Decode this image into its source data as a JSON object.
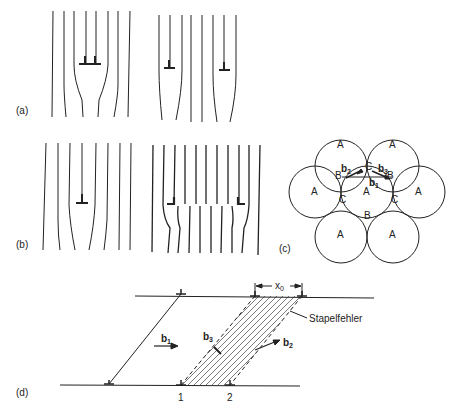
{
  "panels": {
    "a": {
      "label": "(a)"
    },
    "b": {
      "label": "(b)"
    },
    "c": {
      "label": "(c)",
      "atoms": [
        "A",
        "A",
        "A",
        "A",
        "A",
        "A",
        "A"
      ],
      "sites": {
        "B": "B",
        "C": "C"
      },
      "vectors": {
        "b1": "b",
        "b1_sub": "1",
        "b2": "b",
        "b2_sub": "2",
        "b3": "b",
        "b3_sub": "3"
      }
    },
    "d": {
      "label": "(d)",
      "x0": "x",
      "x0_sub": "0",
      "stacking_fault": "Stapelfehler",
      "b1": "b",
      "b1_sub": "1",
      "b2": "b",
      "b2_sub": "2",
      "b3": "b",
      "b3_sub": "3",
      "partial_1": "1",
      "partial_2": "2"
    }
  },
  "colors": {
    "line": "#222222",
    "background": "#ffffff"
  }
}
